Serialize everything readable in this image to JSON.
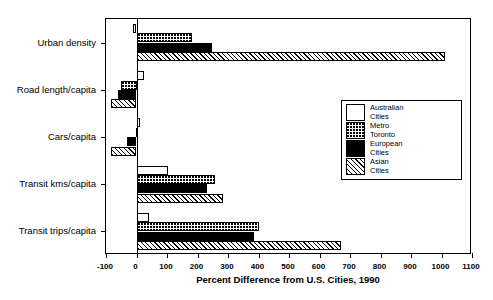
{
  "chart_data": {
    "type": "bar",
    "orientation": "horizontal",
    "title": "",
    "xlabel": "Percent Difference from U.S. Cities, 1990",
    "ylabel": "",
    "xlim": [
      -100,
      1100
    ],
    "xticks": [
      -100,
      0,
      100,
      200,
      300,
      400,
      500,
      600,
      700,
      800,
      900,
      1000,
      1100
    ],
    "xticklabels": [
      "-100",
      "0",
      "100",
      "200",
      "300",
      "400",
      "500",
      "600",
      "700",
      "800",
      "900",
      "1000",
      "1100"
    ],
    "grid": false,
    "zero_reference_line": 0,
    "categories": [
      "Urban density",
      "Road length/capita",
      "Cars/capita",
      "Transit kms/capita",
      "Transit trips/capita"
    ],
    "legend_position": "right-middle",
    "series": [
      {
        "name": "Australian Cities",
        "fill": "white",
        "values": [
          -10,
          25,
          12,
          104,
          42
        ]
      },
      {
        "name": "Metro Toronto",
        "fill": "dotted",
        "values": [
          182,
          -50,
          -3,
          259,
          401
        ]
      },
      {
        "name": "European Cities",
        "fill": "black",
        "values": [
          247,
          -60,
          -30,
          232,
          386
        ]
      },
      {
        "name": "Asian Cities",
        "fill": "hatched",
        "values": [
          1010,
          -83,
          -85,
          283,
          670
        ]
      }
    ]
  },
  "legend": {
    "entries": [
      {
        "line1": "Australian",
        "line2": "Cities",
        "swatch": "white"
      },
      {
        "line1": "Metro",
        "line2": "Toronto",
        "swatch": "dotted"
      },
      {
        "line1": "European",
        "line2": "Cities",
        "swatch": "black"
      },
      {
        "line1": "Asian",
        "line2": "Cities",
        "swatch": "hatched"
      }
    ]
  }
}
